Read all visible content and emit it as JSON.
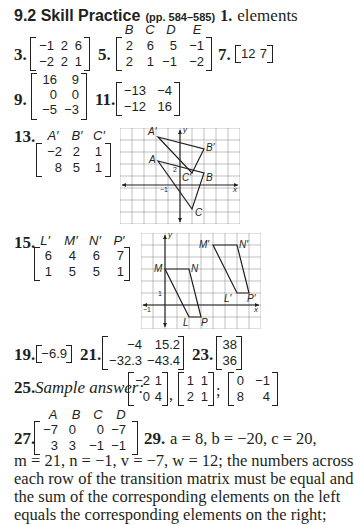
{
  "section": {
    "title": "9.2 Skill Practice",
    "pages": "(pp. 584–585)"
  },
  "answers": {
    "a1": {
      "num": "1.",
      "text": "elements"
    },
    "a3": {
      "num": "3.",
      "matrix": [
        [
          "−1",
          "2",
          "6"
        ],
        [
          "−2",
          "2",
          "1"
        ]
      ]
    },
    "a5": {
      "num": "5.",
      "headers": [
        "B",
        "C",
        "D",
        "E"
      ],
      "matrix": [
        [
          "2",
          "6",
          "5",
          "−1"
        ],
        [
          "2",
          "1",
          "−1",
          "−2"
        ]
      ]
    },
    "a7": {
      "num": "7.",
      "matrix": [
        [
          "12",
          "7"
        ]
      ]
    },
    "a9": {
      "num": "9.",
      "matrix": [
        [
          "16",
          "9"
        ],
        [
          "0",
          "0"
        ],
        [
          "−5",
          "−3"
        ]
      ]
    },
    "a11": {
      "num": "11.",
      "matrix": [
        [
          "−13",
          "−4"
        ],
        [
          "−12",
          "16"
        ]
      ]
    },
    "a13": {
      "num": "13.",
      "headers": [
        "A′",
        "B′",
        "C′"
      ],
      "matrix": [
        [
          "−2",
          "2",
          "1"
        ],
        [
          "8",
          "5",
          "1"
        ]
      ],
      "graph": {
        "labels": {
          "A": "A",
          "B": "B",
          "C": "C",
          "Ap": "A′",
          "Bp": "B′",
          "Cp": "C′",
          "x": "x",
          "y": "y",
          "tick_x": "−1",
          "tick_y": "2"
        }
      }
    },
    "a15": {
      "num": "15.",
      "headers": [
        "L′",
        "M′",
        "N′",
        "P′"
      ],
      "matrix": [
        [
          "6",
          "4",
          "6",
          "7"
        ],
        [
          "1",
          "5",
          "5",
          "1"
        ]
      ],
      "graph": {
        "labels": {
          "L": "L",
          "M": "M",
          "N": "N",
          "P": "P",
          "Lp": "L′",
          "Mp": "M′",
          "Np": "N′",
          "Pp": "P′",
          "x": "x",
          "y": "y",
          "tick_x": "−1",
          "tick_y": "1"
        }
      }
    },
    "a19": {
      "num": "19.",
      "matrix": [
        [
          "−6.9"
        ]
      ]
    },
    "a21": {
      "num": "21.",
      "matrix": [
        [
          "−4",
          "15.2"
        ],
        [
          "−32.3",
          "−43.4"
        ]
      ]
    },
    "a23": {
      "num": "23.",
      "matrix": [
        [
          "38"
        ],
        [
          "36"
        ]
      ]
    },
    "a25": {
      "num": "25.",
      "label": "Sample answer:",
      "m1": [
        [
          "−2",
          "1"
        ],
        [
          "0",
          "4"
        ]
      ],
      "sep1": ",",
      "m2": [
        [
          "1",
          "1"
        ],
        [
          "2",
          "1"
        ]
      ],
      "sep2": ";",
      "m3": [
        [
          "0",
          "−1"
        ],
        [
          "8",
          "4"
        ]
      ]
    },
    "a27": {
      "num": "27.",
      "headers": [
        "A",
        "B",
        "C",
        "D"
      ],
      "matrix": [
        [
          "−7",
          "0",
          "0",
          "−7"
        ],
        [
          "3",
          "3",
          "−1",
          "−1"
        ]
      ]
    },
    "a29": {
      "num": "29.",
      "line1": "a = 8, b = −20, c = 20,",
      "line2": "m = 21, n = −1, v = −7, w = 12; the numbers across",
      "line3": "each row of the transition matrix must be equal and",
      "line4": "the sum of the corresponding elements on the left",
      "line5": "equals the corresponding elements on the right;"
    }
  }
}
